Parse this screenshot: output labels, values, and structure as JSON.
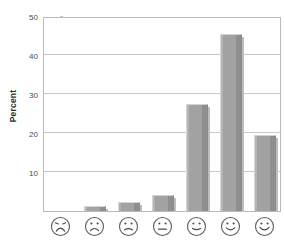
{
  "chart_data": {
    "type": "bar",
    "title": "",
    "subtitle": "",
    "xlabel": "",
    "ylabel": "Percent",
    "ylim": [
      0,
      50
    ],
    "yticks": [
      10,
      20,
      30,
      40,
      50
    ],
    "ytick_labels": [
      "10",
      "20",
      "30",
      "40",
      "50"
    ],
    "grid": true,
    "legend": false,
    "legend_position": "none",
    "bar_color": "#9d9d9d",
    "categories": [
      "very-sad-face",
      "sad-face",
      "slightly-sad-face",
      "neutral-face",
      "slightly-happy-face",
      "happy-face",
      "very-happy-face"
    ],
    "category_labels": [
      "",
      "",
      "",
      "",
      "",
      "",
      ""
    ],
    "values": [
      0,
      1.3,
      2.3,
      4.0,
      27.5,
      45.5,
      19.5
    ],
    "annotations": []
  },
  "axis": {
    "y_title": "Percent"
  },
  "faces": [
    {
      "name": "very-sad-face",
      "mouth": "deep-frown",
      "eyes": "angled-sad"
    },
    {
      "name": "sad-face",
      "mouth": "frown",
      "eyes": "dots"
    },
    {
      "name": "slightly-sad-face",
      "mouth": "slight-frown",
      "eyes": "dots"
    },
    {
      "name": "neutral-face",
      "mouth": "flat",
      "eyes": "dots"
    },
    {
      "name": "slightly-happy-face",
      "mouth": "slight-smile",
      "eyes": "dots"
    },
    {
      "name": "happy-face",
      "mouth": "smile",
      "eyes": "dots"
    },
    {
      "name": "very-happy-face",
      "mouth": "big-smile",
      "eyes": "dots"
    }
  ]
}
